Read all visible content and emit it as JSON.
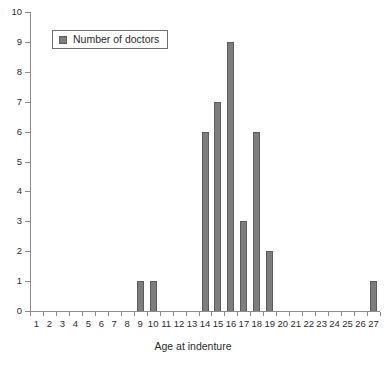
{
  "chart_data": {
    "type": "bar",
    "title": "",
    "xlabel": "Age at indenture",
    "ylabel": "",
    "categories": [
      "1",
      "2",
      "3",
      "4",
      "5",
      "6",
      "7",
      "8",
      "9",
      "10",
      "11",
      "12",
      "13",
      "14",
      "15",
      "16",
      "17",
      "18",
      "19",
      "20",
      "21",
      "22",
      "23",
      "24",
      "25",
      "26",
      "27"
    ],
    "values": [
      0,
      0,
      0,
      0,
      0,
      0,
      0,
      0,
      1,
      1,
      0,
      0,
      0,
      6,
      7,
      9,
      3,
      6,
      2,
      0,
      0,
      0,
      0,
      0,
      0,
      0,
      1
    ],
    "series": [
      {
        "name": "Number of doctors",
        "values": [
          0,
          0,
          0,
          0,
          0,
          0,
          0,
          0,
          1,
          1,
          0,
          0,
          0,
          6,
          7,
          9,
          3,
          6,
          2,
          0,
          0,
          0,
          0,
          0,
          0,
          0,
          1
        ]
      }
    ],
    "ylim": [
      0,
      10
    ],
    "yticks": [
      "0",
      "1",
      "2",
      "3",
      "4",
      "5",
      "6",
      "7",
      "8",
      "9",
      "10"
    ],
    "grid": false,
    "legend": {
      "position": "top-left",
      "entries": [
        "Number of doctors"
      ]
    },
    "colors": {
      "bar_fill": "#7d7d7d",
      "bar_stroke": "#5c5c5c",
      "axis": "#8a8a8a",
      "text": "#2b2b2b",
      "background": "#ffffff"
    }
  }
}
